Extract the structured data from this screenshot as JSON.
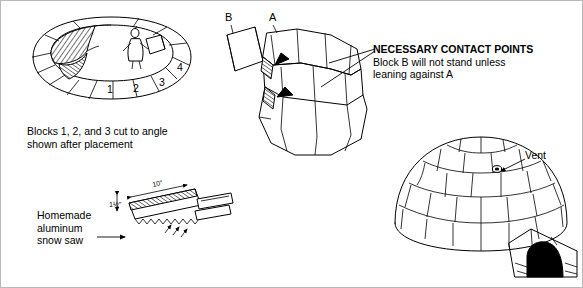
{
  "figure": {
    "panels": [
      {
        "id": "panel-blocks-123",
        "caption_lines": [
          "Blocks 1, 2, and 3 cut to angle",
          "shown after placement"
        ],
        "block_numbers": [
          "1",
          "2",
          "3",
          "4"
        ]
      },
      {
        "id": "panel-contact-points",
        "labels": {
          "block_b": "B",
          "block_a": "A"
        },
        "annotation_lines": [
          "NECESSARY CONTACT POINTS",
          "Block B will not stand unless",
          "leaning against A"
        ]
      },
      {
        "id": "panel-snow-saw",
        "caption_lines": [
          "Homemade",
          "aluminum",
          "snow saw"
        ],
        "dimensions": {
          "length": "10\"",
          "width": "1½\""
        }
      },
      {
        "id": "panel-finished-igloo",
        "labels": {
          "vent": "Vent"
        }
      }
    ]
  },
  "colors": {
    "ink": "#000000",
    "paper": "#ffffff",
    "border": "#b9b9b9"
  }
}
